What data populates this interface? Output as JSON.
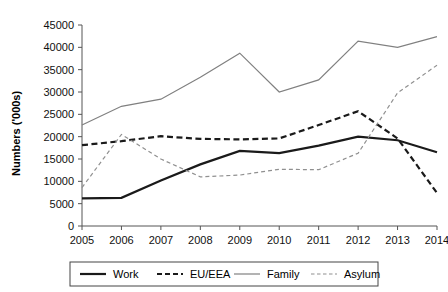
{
  "chart_data": {
    "type": "line",
    "title": "",
    "xlabel": "",
    "ylabel": "Numbers ('000s)",
    "categories": [
      "2005",
      "2006",
      "2007",
      "2008",
      "2009",
      "2010",
      "2011",
      "2012",
      "2013",
      "2014"
    ],
    "x": [
      2005,
      2006,
      2007,
      2008,
      2009,
      2010,
      2011,
      2012,
      2013,
      2014
    ],
    "ylim": [
      0,
      45000
    ],
    "yticks": [
      0,
      5000,
      10000,
      15000,
      20000,
      25000,
      30000,
      35000,
      40000,
      45000
    ],
    "ytick_labels": [
      "0",
      "5000",
      "10000",
      "15000",
      "20000",
      "25000",
      "30000",
      "35000",
      "40000",
      "45000"
    ],
    "grid": false,
    "legend_position": "bottom",
    "series": [
      {
        "name": "Work",
        "values": [
          6200,
          6300,
          10200,
          13800,
          16800,
          16300,
          18000,
          20000,
          19200,
          16500
        ],
        "color": "#1a1a1a",
        "style": "solid",
        "width": 2.2
      },
      {
        "name": "EU/EEA",
        "values": [
          18100,
          19000,
          20100,
          19500,
          19400,
          19600,
          22600,
          25700,
          19600,
          7400
        ],
        "color": "#1a1a1a",
        "style": "dashed",
        "width": 2.2
      },
      {
        "name": "Family",
        "values": [
          22600,
          26800,
          28400,
          33300,
          38700,
          30000,
          32700,
          41400,
          40000,
          42400
        ],
        "color": "#808080",
        "style": "solid",
        "width": 1.2
      },
      {
        "name": "Asylum",
        "values": [
          8600,
          20500,
          15000,
          11000,
          11400,
          12700,
          12600,
          16300,
          29800,
          36000
        ],
        "color": "#909090",
        "style": "dashed",
        "width": 1.2
      }
    ]
  },
  "legend": {
    "items": [
      {
        "label": "Work",
        "swatch": "work-line-swatch"
      },
      {
        "label": "EU/EEA",
        "swatch": "eu-eea-line-swatch"
      },
      {
        "label": "Family",
        "swatch": "family-line-swatch"
      },
      {
        "label": "Asylum",
        "swatch": "asylum-line-swatch"
      }
    ]
  }
}
